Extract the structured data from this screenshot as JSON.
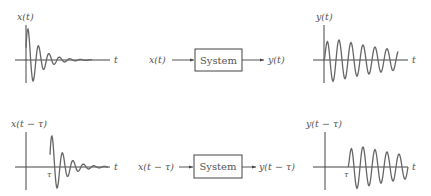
{
  "diagram": {
    "top_row": {
      "input_plot": {
        "ylabel": "x(t)",
        "xlabel": "t"
      },
      "block": {
        "input": "x(t)",
        "label": "System",
        "output": "y(t)"
      },
      "output_plot": {
        "ylabel": "y(t)",
        "xlabel": "t"
      }
    },
    "bottom_row": {
      "input_plot": {
        "ylabel": "x(t − τ)",
        "xlabel": "t",
        "tick": "τ"
      },
      "block": {
        "input": "x(t − τ)",
        "label": "System",
        "output": "y(t − τ)"
      },
      "output_plot": {
        "ylabel": "y(t − τ)",
        "xlabel": "t",
        "tick": "τ"
      }
    }
  },
  "colors": {
    "axis": "#444444",
    "waveform": "#666666",
    "text": "#555555"
  }
}
